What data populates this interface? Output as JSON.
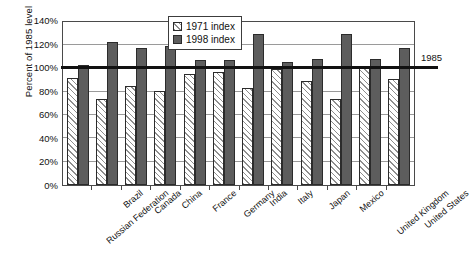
{
  "chart_data": {
    "type": "bar",
    "title": "",
    "xlabel": "",
    "ylabel": "Percent of 1985 level",
    "ylim": [
      0,
      140
    ],
    "ytick_labels": [
      "140%",
      "120%",
      "100%",
      "80%",
      "60%",
      "40%",
      "20%",
      "0%"
    ],
    "ytick_values": [
      140,
      120,
      100,
      80,
      60,
      40,
      20,
      0
    ],
    "grid": true,
    "legend_position": "top-center",
    "categories": [
      "Russian Federation",
      "Brazil",
      "Canada",
      "China",
      "France",
      "Germany",
      "India",
      "Italy",
      "Japan",
      "Mexico",
      "United Kingdom",
      "United States"
    ],
    "series": [
      {
        "name": "1971 index",
        "color": "#ffffff",
        "pattern": "diagonal-hatch",
        "values": [
          92,
          74,
          85,
          81,
          95,
          97,
          83,
          100,
          89,
          74,
          102,
          91
        ]
      },
      {
        "name": "1998 index",
        "color": "#5d5d5d",
        "pattern": "solid",
        "values": [
          103,
          123,
          118,
          119,
          107,
          107,
          130,
          106,
          108,
          130,
          108,
          118
        ]
      }
    ],
    "annotations": [
      {
        "text": "1985",
        "value": 100,
        "position": "right-of-axis"
      }
    ],
    "reference_line": {
      "value": 100,
      "label": "1985",
      "color": "#111111"
    }
  }
}
